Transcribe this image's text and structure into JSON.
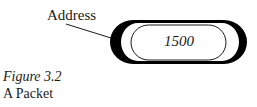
{
  "diagram": {
    "label": "Address",
    "packet": {
      "value": "1500"
    }
  },
  "caption": {
    "number": "Figure 3.2",
    "title": "A Packet"
  },
  "colors": {
    "ink": "#000000",
    "background": "#ffffff"
  }
}
